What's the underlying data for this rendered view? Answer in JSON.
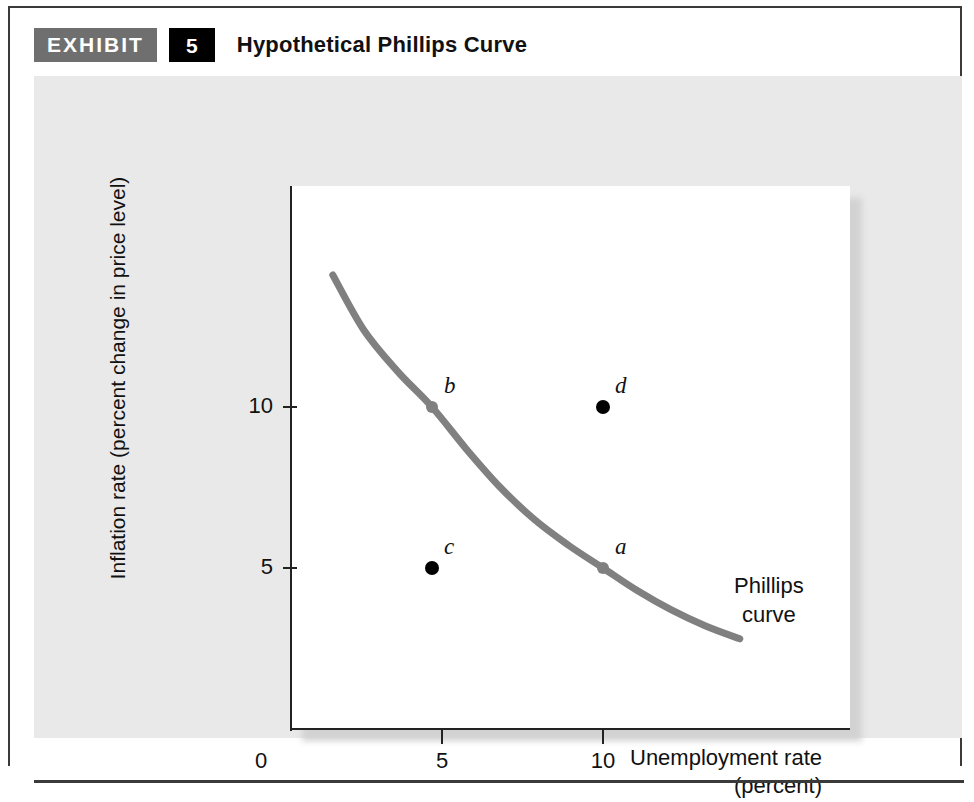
{
  "exhibit": {
    "badge_label": "EXHIBIT",
    "number": "5",
    "title": "Hypothetical Phillips Curve"
  },
  "colors": {
    "panel_background": "#e9e9e9",
    "plot_background": "#ffffff",
    "curve": "#808080",
    "curve_point": "#808080",
    "plain_point": "#000000",
    "axis": "#222222",
    "badge_gray": "#6f6f6f",
    "badge_black": "#000000"
  },
  "chart_data": {
    "type": "line",
    "title": "Hypothetical Phillips Curve",
    "xlabel_line1": "Unemployment rate",
    "xlabel_line2": "(percent)",
    "ylabel": "Inflation rate (percent change in price level)",
    "xlim": [
      0,
      15
    ],
    "ylim": [
      0,
      17
    ],
    "grid": false,
    "x_ticks": [
      {
        "value": 0,
        "label": "0",
        "px": 227
      },
      {
        "value": 5,
        "label": "5",
        "px": 408
      },
      {
        "value": 10,
        "label": "10",
        "px": 569
      }
    ],
    "y_ticks": [
      {
        "value": 10,
        "label": "10",
        "px": 331
      },
      {
        "value": 5,
        "label": "5",
        "px": 492
      }
    ],
    "series": [
      {
        "name": "Phillips curve",
        "annotation_line1": "Phillips",
        "annotation_line2": "curve",
        "points": [
          {
            "x": 2.1,
            "y": 14.1
          },
          {
            "x": 3.0,
            "y": 12.4
          },
          {
            "x": 4.0,
            "y": 11.1
          },
          {
            "x": 5.0,
            "y": 10.0
          },
          {
            "x": 6.0,
            "y": 8.7
          },
          {
            "x": 7.0,
            "y": 7.5
          },
          {
            "x": 8.0,
            "y": 6.5
          },
          {
            "x": 9.0,
            "y": 5.7
          },
          {
            "x": 10.0,
            "y": 5.0
          },
          {
            "x": 11.0,
            "y": 4.3
          },
          {
            "x": 12.0,
            "y": 3.7
          },
          {
            "x": 13.0,
            "y": 3.2
          },
          {
            "x": 14.0,
            "y": 2.8
          }
        ]
      }
    ],
    "labeled_points": [
      {
        "id": "a",
        "label": "a",
        "x": 10,
        "y": 5,
        "on_curve": true,
        "color": "#808080"
      },
      {
        "id": "b",
        "label": "b",
        "x": 5,
        "y": 10,
        "on_curve": true,
        "color": "#808080"
      },
      {
        "id": "c",
        "label": "c",
        "x": 5,
        "y": 5,
        "on_curve": false,
        "color": "#000000"
      },
      {
        "id": "d",
        "label": "d",
        "x": 10,
        "y": 10,
        "on_curve": false,
        "color": "#000000"
      }
    ]
  }
}
